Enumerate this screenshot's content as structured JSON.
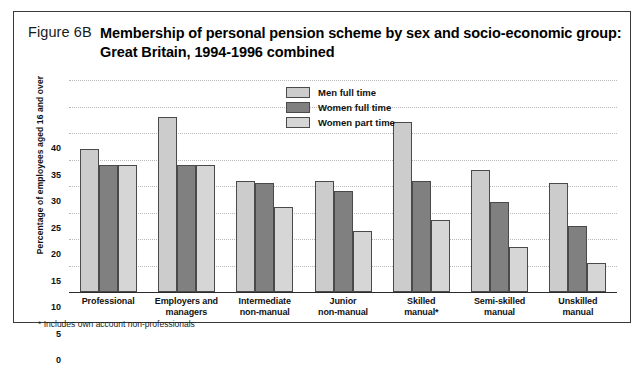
{
  "figure": {
    "number": "Figure 6B",
    "title_line1": "Membership of personal pension scheme by sex and socio-economic group:",
    "title_line2": "Great Britain, 1994-1996 combined",
    "footnote": "* Includes own account non-professionals"
  },
  "legend": {
    "position": "inside-top-center",
    "items": [
      {
        "label": "Men full time",
        "color": "#cccccc",
        "key": "men"
      },
      {
        "label": "Women full time",
        "color": "#808080",
        "key": "wft"
      },
      {
        "label": "Women part time",
        "color": "#d6d6d6",
        "key": "wpt"
      }
    ]
  },
  "axes": {
    "ylabel": "Percentage of employees aged 16 and over",
    "xlabel": "",
    "yticks": [
      0,
      5,
      10,
      15,
      20,
      25,
      30,
      35,
      40
    ],
    "ylim": [
      0,
      40
    ],
    "grid": true
  },
  "chart_data": {
    "type": "bar",
    "title": "Membership of personal pension scheme by sex and socio-economic group: Great Britain, 1994-1996 combined",
    "xlabel": "",
    "ylabel": "Percentage of employees aged 16 and over",
    "ylim": [
      0,
      40
    ],
    "ytick_step": 5,
    "grid": true,
    "legend_position": "inside-top-center",
    "categories": [
      "Professional",
      "Employers and managers",
      "Intermediate non-manual",
      "Junior non-manual",
      "Skilled manual*",
      "Semi-skilled manual",
      "Unskilled manual"
    ],
    "category_lines": [
      [
        "Professional",
        ""
      ],
      [
        "Employers and",
        "managers"
      ],
      [
        "Intermediate",
        "non-manual"
      ],
      [
        "Junior",
        "non-manual"
      ],
      [
        "Skilled",
        "manual*"
      ],
      [
        "Semi-skilled",
        "manual"
      ],
      [
        "Unskilled",
        "manual"
      ]
    ],
    "series": [
      {
        "name": "Men full time",
        "color": "#cccccc",
        "values": [
          27,
          33,
          21,
          21,
          32,
          23,
          20.5
        ]
      },
      {
        "name": "Women full time",
        "color": "#808080",
        "values": [
          24,
          24,
          20.5,
          19,
          21,
          17,
          12.5
        ]
      },
      {
        "name": "Women part time",
        "color": "#d6d6d6",
        "values": [
          24,
          24,
          16,
          11.5,
          13.5,
          8.5,
          5.5
        ]
      }
    ],
    "annotations": [
      "* Includes own account non-professionals"
    ]
  }
}
